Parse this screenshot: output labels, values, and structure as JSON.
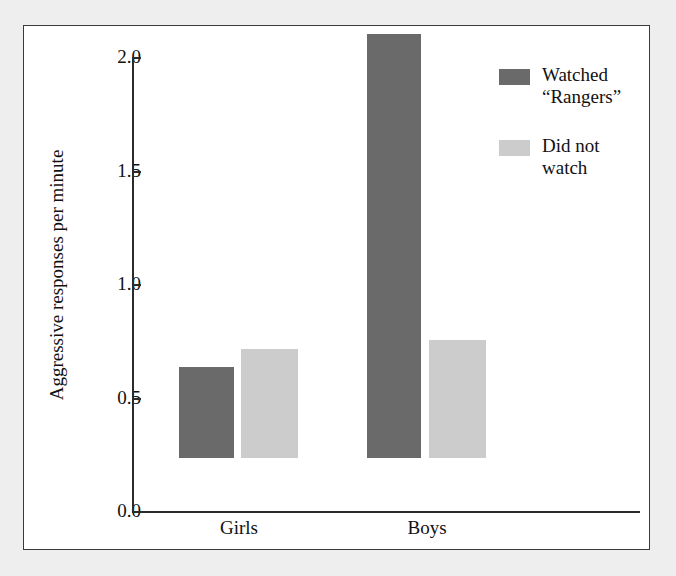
{
  "chart_data": {
    "type": "bar",
    "title": "",
    "xlabel": "",
    "ylabel": "Aggressive responses per minute",
    "categories": [
      "Girls",
      "Boys"
    ],
    "ylim": [
      0.0,
      2.0
    ],
    "yticks": [
      "0.0",
      "0.5",
      "1.0",
      "1.5",
      "2.0"
    ],
    "ytick_values": [
      0.0,
      0.5,
      1.0,
      1.5,
      2.0
    ],
    "grid": false,
    "legend_position": "top-right",
    "series": [
      {
        "name": "Watched “Rangers”",
        "color": "#6a6a6a",
        "values": [
          0.4,
          1.87
        ]
      },
      {
        "name": "Did not watch",
        "color": "#cccccc",
        "values": [
          0.48,
          0.52
        ]
      }
    ]
  },
  "legend": {
    "items": [
      {
        "label": "Watched\n“Rangers”",
        "color": "#6a6a6a"
      },
      {
        "label": "Did not\nwatch",
        "color": "#cccccc"
      }
    ]
  },
  "axes": {
    "y_title": "Aggressive responses per minute",
    "y_labels": [
      "2.0",
      "1.5",
      "1.0",
      "0.5",
      "0.0"
    ],
    "x_labels": [
      "Girls",
      "Boys"
    ]
  },
  "colors": {
    "bar_dark": "#6a6a6a",
    "bar_light": "#cccccc",
    "axis": "#2b2b2b",
    "frame": "#3a3a3a",
    "page_background": "#eeeeee",
    "plot_background": "#ffffff"
  }
}
